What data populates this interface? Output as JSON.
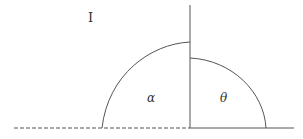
{
  "diagram": {
    "region_label": "I",
    "angle_left_label": "α",
    "angle_right_label": "θ",
    "line_color": "#555555",
    "baseline": {
      "y": 128,
      "dashed_from_x": 14,
      "dashed_to_x": 190,
      "solid_from_x": 190,
      "solid_to_x": 294
    },
    "vertical_line": {
      "x": 190,
      "y_top": 5,
      "y_bottom": 128
    },
    "left_arc": {
      "start": [
        102,
        128
      ],
      "end": [
        190,
        42
      ]
    },
    "right_arc": {
      "start": [
        190,
        58
      ],
      "end": [
        266,
        128
      ]
    }
  }
}
